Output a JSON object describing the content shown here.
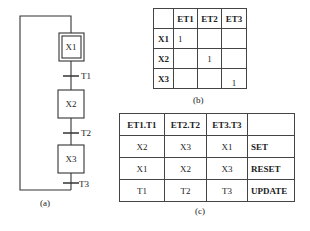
{
  "diagram_a": {
    "caption": "(a)",
    "steps": [
      {
        "label": "X1",
        "initial": true
      },
      {
        "label": "X2",
        "initial": false
      },
      {
        "label": "X3",
        "initial": false
      }
    ],
    "transitions": [
      "T1",
      "T2",
      "T3"
    ]
  },
  "table_b": {
    "caption": "(b)",
    "columns": [
      "",
      "ET1",
      "ET2",
      "ET3"
    ],
    "rows": [
      {
        "head": "X1",
        "cells": [
          "1",
          "",
          ""
        ]
      },
      {
        "head": "X2",
        "cells": [
          "",
          "1",
          ""
        ]
      },
      {
        "head": "X3",
        "cells": [
          "",
          "",
          "1"
        ]
      }
    ]
  },
  "table_c": {
    "caption": "(c)",
    "columns": [
      "ET1.T1",
      "ET2.T2",
      "ET3.T3",
      ""
    ],
    "rows": [
      {
        "cells": [
          "X2",
          "X3",
          "X1"
        ],
        "action": "SET"
      },
      {
        "cells": [
          "X1",
          "X2",
          "X3"
        ],
        "action": "RESET"
      },
      {
        "cells": [
          "T1",
          "T2",
          "T3"
        ],
        "action": "UPDATE"
      }
    ]
  }
}
